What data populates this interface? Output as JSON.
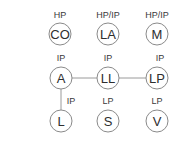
{
  "diagram": {
    "type": "node-grid",
    "colors": {
      "node_stroke": "#8a8a8a",
      "edge_stroke": "#9a9a9a",
      "text": "#2e2e2e",
      "background": "#ffffff"
    },
    "nodes": [
      {
        "id": "CO",
        "label": "CO",
        "tag": "HP",
        "cx": 60,
        "cy": 34
      },
      {
        "id": "LA",
        "label": "LA",
        "tag": "HP/IP",
        "cx": 108,
        "cy": 34
      },
      {
        "id": "M",
        "label": "M",
        "tag": "HP/IP",
        "cx": 157,
        "cy": 34
      },
      {
        "id": "A",
        "label": "A",
        "tag": "IP",
        "cx": 61,
        "cy": 78
      },
      {
        "id": "LL",
        "label": "LL",
        "tag": "IP",
        "cx": 108,
        "cy": 78
      },
      {
        "id": "LP",
        "label": "LP",
        "tag": "IP",
        "cx": 157,
        "cy": 78
      },
      {
        "id": "L",
        "label": "L",
        "tag": "IP",
        "cx": 61,
        "cy": 121
      },
      {
        "id": "S",
        "label": "S",
        "tag": "LP",
        "cx": 108,
        "cy": 121
      },
      {
        "id": "V",
        "label": "V",
        "tag": "LP",
        "cx": 157,
        "cy": 121
      }
    ],
    "edges": [
      {
        "from": "A",
        "to": "LL"
      },
      {
        "from": "LL",
        "to": "LP"
      },
      {
        "from": "A",
        "to": "L"
      }
    ]
  }
}
